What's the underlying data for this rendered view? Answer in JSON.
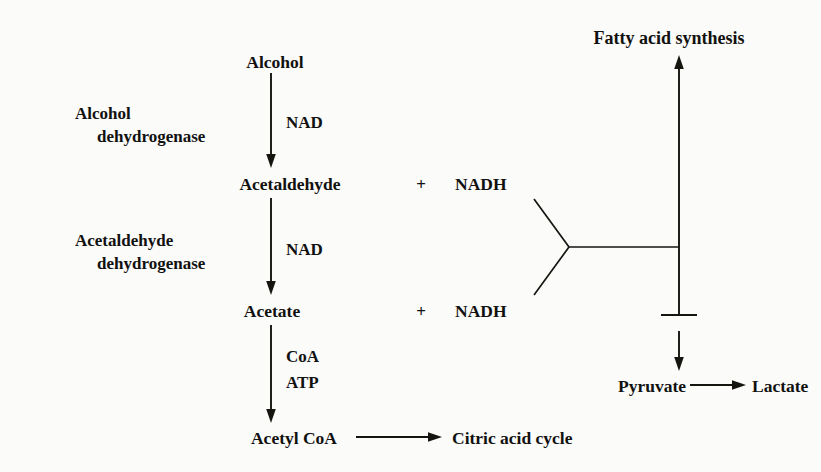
{
  "diagram": {
    "colors": {
      "background": "#fbfbfa",
      "ink": "#15140f",
      "text": "#111110"
    },
    "metabolites": {
      "alcohol": "Alcohol",
      "acetaldehyde": "Acetaldehyde",
      "acetate": "Acetate",
      "acetyl_coa": "Acetyl CoA",
      "citric_acid_cycle": "Citric acid cycle",
      "pyruvate": "Pyruvate",
      "lactate": "Lactate",
      "fatty_acid_synthesis": "Fatty acid synthesis"
    },
    "enzymes": [
      {
        "line1": "Alcohol",
        "line2": "dehydrogenase"
      },
      {
        "line1": "Acetaldehyde",
        "line2": "dehydrogenase"
      }
    ],
    "cofactors": {
      "nad_step1": "NAD",
      "nad_step2": "NAD",
      "coa": "CoA",
      "atp": "ATP"
    },
    "products": {
      "nadh_upper": "NADH",
      "nadh_lower": "NADH",
      "plus_upper": "+",
      "plus_lower": "+"
    }
  }
}
